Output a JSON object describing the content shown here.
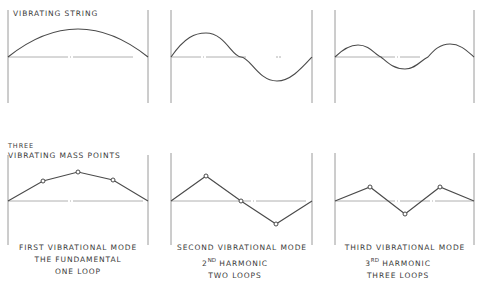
{
  "labels": {
    "top": "Vibrating String",
    "bottom_line1": "Three",
    "bottom_line2": "Vibrating Mass Points"
  },
  "captions": [
    {
      "line1": "First Vibrational Mode",
      "line2": "The Fundamental",
      "line3": "One Loop"
    },
    {
      "line1": "Second Vibrational Mode",
      "line2_num": "2",
      "line2_sup": "nd",
      "line2_rest": " Harmonic",
      "line3": "Two Loops"
    },
    {
      "line1": "Third Vibrational Mode",
      "line2_num": "3",
      "line2_sup": "rd",
      "line2_rest": " Harmonic",
      "line3": "Three Loops"
    }
  ],
  "colors": {
    "ink": "#4a4a4a",
    "frame": "#9a9a9a",
    "baseline": "#b0b0b0"
  },
  "panels": [
    {
      "mode": 1,
      "x_left": 8,
      "x_right": 148,
      "string_amplitude": 28,
      "mass_points_y": [
        -21,
        -29,
        -21
      ]
    },
    {
      "mode": 2,
      "x_left": 171,
      "x_right": 312,
      "string_amplitude": 24,
      "mass_points_y": [
        -27,
        0,
        27
      ]
    },
    {
      "mode": 3,
      "x_left": 335,
      "x_right": 474,
      "string_amplitude": 12,
      "mass_points_y": [
        -14,
        13,
        -14
      ]
    }
  ]
}
